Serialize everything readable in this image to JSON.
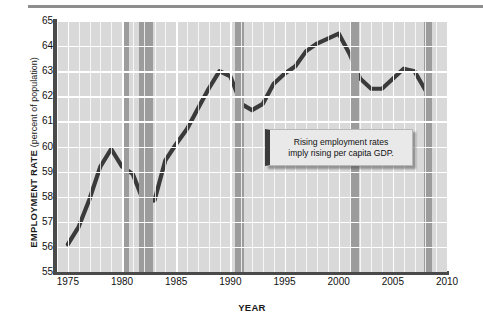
{
  "figure": {
    "y_axis_title_main": "EMPLOYMENT RATE",
    "y_axis_title_sub": "(percent of population)",
    "x_axis_title": "YEAR",
    "callout_line1": "Rising employment rates",
    "callout_line2": "imply rising per capita GDP.",
    "colors": {
      "plot_background": "#d9d9d9",
      "gridline": "#ffffff",
      "recession_band": "#9c9c9c",
      "data_line": "#3a3a3a",
      "axis": "#4a4a4a",
      "callout_background": "#e9e9e9",
      "callout_accent": "#3b3b3b"
    }
  },
  "chart_data": {
    "type": "line",
    "title": "",
    "xlabel": "YEAR",
    "ylabel": "EMPLOYMENT RATE (percent of population)",
    "xlim": [
      1974,
      2010
    ],
    "ylim": [
      55,
      65
    ],
    "ytick_labels": [
      "65",
      "64",
      "63",
      "62",
      "61",
      "60",
      "59",
      "58",
      "57",
      "56",
      "55"
    ],
    "ytick_values": [
      65,
      64,
      63,
      62,
      61,
      60,
      59,
      58,
      57,
      56,
      55
    ],
    "xtick_labels": [
      "1975",
      "1980",
      "1985",
      "1990",
      "1995",
      "2000",
      "2005",
      "2010"
    ],
    "xtick_values": [
      1975,
      1980,
      1985,
      1990,
      1995,
      2000,
      2005,
      2010
    ],
    "grid": true,
    "legend": "none",
    "series": [
      {
        "name": "Employment rate",
        "x": [
          1975,
          1976,
          1977,
          1978,
          1979,
          1980,
          1981,
          1982,
          1983,
          1984,
          1985,
          1986,
          1987,
          1988,
          1989,
          1990,
          1991,
          1992,
          1993,
          1994,
          1995,
          1996,
          1997,
          1998,
          1999,
          2000,
          2001,
          2002,
          2003,
          2004,
          2005,
          2006,
          2007,
          2008
        ],
        "values": [
          56.1,
          56.8,
          57.9,
          59.2,
          59.9,
          59.2,
          58.9,
          57.8,
          57.85,
          59.45,
          60.1,
          60.7,
          61.5,
          62.3,
          63.0,
          62.8,
          61.7,
          61.45,
          61.7,
          62.5,
          62.9,
          63.2,
          63.8,
          64.1,
          64.3,
          64.5,
          63.7,
          62.7,
          62.3,
          62.3,
          62.7,
          63.1,
          63.0,
          62.25
        ]
      }
    ],
    "recession_bands": [
      {
        "start": 1980.0,
        "end": 1980.6
      },
      {
        "start": 1981.6,
        "end": 1982.9
      },
      {
        "start": 1990.4,
        "end": 1991.3
      },
      {
        "start": 2001.1,
        "end": 2001.9
      },
      {
        "start": 2007.9,
        "end": 2008.6
      }
    ],
    "annotations": [
      {
        "text": "Rising employment rates imply rising per capita GDP.",
        "x": 1998,
        "y": 60.5
      }
    ]
  }
}
